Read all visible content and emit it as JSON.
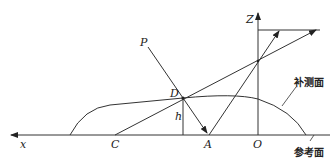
{
  "diagram": {
    "labels": {
      "x_axis": "x",
      "z_axis": "Z",
      "point_p": "P",
      "point_d": "D",
      "height": "h",
      "point_c": "C",
      "point_a": "A",
      "origin": "O",
      "supplementary_surface": "补测面",
      "reference_surface": "参考面"
    },
    "colors": {
      "stroke": "#333333",
      "background": "#ffffff"
    }
  }
}
